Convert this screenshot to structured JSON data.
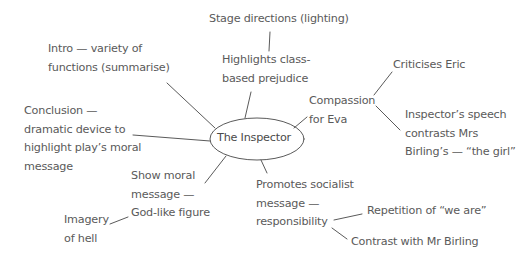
{
  "diagram": {
    "type": "mind-map",
    "colors": {
      "line": "#5a5a5a",
      "text": "#5a5a5a",
      "background": "#ffffff"
    },
    "center": {
      "label": "The Inspector"
    },
    "nodes": {
      "stage_directions": "Stage directions (lighting)",
      "highlights_class": "Highlights class-\nbased prejudice",
      "intro": "Intro — variety of\nfunctions (summarise)",
      "conclusion": "Conclusion —\ndramatic device to\nhighlight play’s moral\nmessage",
      "compassion": "Compassion\nfor Eva",
      "criticises_eric": "Criticises Eric",
      "inspectors_speech": "Inspector’s speech\ncontrasts Mrs\nBirling’s — “the girl”",
      "show_moral": "Show moral\nmessage —\nGod-like figure",
      "imagery_hell": "Imagery\nof hell",
      "promotes_socialist": "Promotes socialist\nmessage —\nresponsibility",
      "repetition": "Repetition of “we are”",
      "contrast_birling": "Contrast with Mr Birling"
    },
    "edges": [
      [
        "The Inspector",
        "Highlights class-based prejudice"
      ],
      [
        "Highlights class-based prejudice",
        "Stage directions (lighting)"
      ],
      [
        "The Inspector",
        "Intro — variety of functions (summarise)"
      ],
      [
        "The Inspector",
        "Conclusion — dramatic device to highlight play’s moral message"
      ],
      [
        "The Inspector",
        "Compassion for Eva"
      ],
      [
        "Compassion for Eva",
        "Criticises Eric"
      ],
      [
        "Compassion for Eva",
        "Inspector’s speech contrasts Mrs Birling’s — “the girl”"
      ],
      [
        "The Inspector",
        "Show moral message — God-like figure"
      ],
      [
        "Show moral message — God-like figure",
        "Imagery of hell"
      ],
      [
        "The Inspector",
        "Promotes socialist message — responsibility"
      ],
      [
        "Promotes socialist message — responsibility",
        "Repetition of “we are”"
      ],
      [
        "Promotes socialist message — responsibility",
        "Contrast with Mr Birling"
      ]
    ]
  }
}
